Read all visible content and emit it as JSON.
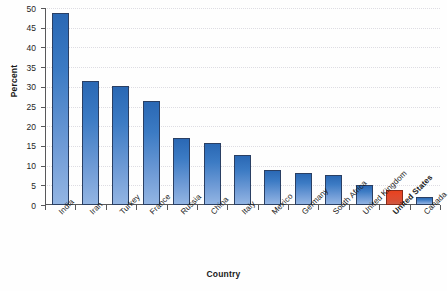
{
  "chart_data": {
    "type": "bar",
    "title": "",
    "xlabel": "Country",
    "ylabel": "Percent",
    "ylim": [
      0,
      50
    ],
    "ytick_step": 5,
    "grid": true,
    "legend": "none",
    "highlight_category": "United States",
    "colors": {
      "bar_top": "#2a68b4",
      "bar_bottom": "#93b5e3",
      "bar_border": "#2a3f63",
      "highlight_top": "#e8421e",
      "highlight_bottom": "#cf5a42",
      "highlight_border": "#8a2a18",
      "axis": "#58585a",
      "gridline": "#dedde3",
      "background": "#fefefe"
    },
    "categories": [
      "India",
      "Iran",
      "Turkey",
      "France",
      "Russia",
      "China",
      "Italy",
      "Mexico",
      "Germany",
      "South Africa",
      "United Kingdom",
      "United States",
      "Canada"
    ],
    "values": [
      48.8,
      31.5,
      30.3,
      26.5,
      17.0,
      15.8,
      12.7,
      9.0,
      8.2,
      7.7,
      5.0,
      3.7,
      2.1
    ],
    "ytick_labels": [
      "0",
      "5",
      "10",
      "15",
      "20",
      "25",
      "30",
      "35",
      "40",
      "45",
      "50"
    ]
  },
  "axes": {
    "y_title": "Percent",
    "x_title": "Country"
  }
}
